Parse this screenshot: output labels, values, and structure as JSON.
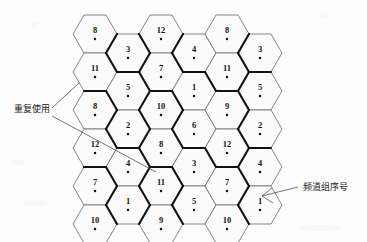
{
  "figure": {
    "background_color": "#fdfdfd",
    "cell_fill": "#fbfbfb",
    "thin_line_color": "#6f6f6f",
    "thick_line_color": "#111111",
    "text_color": "#141414"
  },
  "geometry": {
    "hex_width": 44,
    "hex_height": 38,
    "col_step": 33,
    "row_step": 38,
    "origin_x": 95,
    "origin_y": 34,
    "note": "flat-left pointy-side hexagons, odd columns offset down by half row"
  },
  "columns": [
    {
      "index": 0,
      "x": 95,
      "y0": 34,
      "cells": [
        "8",
        "11",
        "8",
        "12",
        "7",
        "10"
      ]
    },
    {
      "index": 1,
      "x": 128,
      "y0": 53,
      "cells": [
        "3",
        "5",
        "2",
        "4",
        "1"
      ]
    },
    {
      "index": 2,
      "x": 161,
      "y0": 34,
      "cells": [
        "12",
        "7",
        "10",
        "8",
        "11",
        "9"
      ]
    },
    {
      "index": 3,
      "x": 194,
      "y0": 53,
      "cells": [
        "4",
        "1",
        "6",
        "3",
        "5"
      ]
    },
    {
      "index": 4,
      "x": 227,
      "y0": 34,
      "cells": [
        "8",
        "11",
        "9",
        "12",
        "7",
        "10"
      ]
    },
    {
      "index": 5,
      "x": 260,
      "y0": 53,
      "cells": [
        "3",
        "5",
        "2",
        "4",
        "1"
      ]
    }
  ],
  "labels": {
    "reuse": {
      "text": "重复使用",
      "x": 14,
      "y": 112
    },
    "channel_group": {
      "text": "频道组序号",
      "x": 303,
      "y": 190
    }
  },
  "leaders": {
    "reuse_short": {
      "from_x": 52,
      "from_y": 108,
      "to_x": 79,
      "to_y": 83
    },
    "reuse_long": {
      "from_x": 52,
      "from_y": 116,
      "to_x": 156,
      "to_y": 172
    },
    "channel_group": {
      "from_x": 298,
      "from_y": 187,
      "to_x": 262,
      "to_y": 196
    }
  }
}
